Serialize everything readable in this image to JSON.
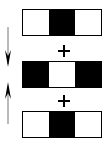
{
  "diagram": {
    "bars": [
      {
        "id": "top",
        "segments": [
          "white",
          "black",
          "white"
        ]
      },
      {
        "id": "middle",
        "segments": [
          "black",
          "white",
          "black"
        ]
      },
      {
        "id": "bottom",
        "segments": [
          "white",
          "black",
          "white"
        ]
      }
    ],
    "operators": [
      "+",
      "+"
    ],
    "arrows": [
      {
        "direction": "down",
        "icon": "arrow-down-icon"
      },
      {
        "direction": "up",
        "icon": "arrow-up-icon"
      }
    ],
    "colors": {
      "fill_dark": "#000000",
      "fill_light": "#ffffff",
      "arrow": "#555555"
    }
  }
}
